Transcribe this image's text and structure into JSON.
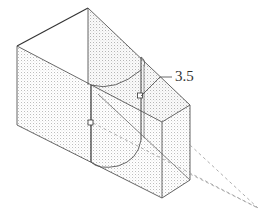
{
  "figure": {
    "type": "isometric technical drawing",
    "dimension_label": "3.5",
    "colors": {
      "line": "#555555",
      "heavy_line": "#333333",
      "hatch": "#c8c8c8",
      "dashed": "#9a9a9a",
      "background": "#ffffff"
    }
  }
}
